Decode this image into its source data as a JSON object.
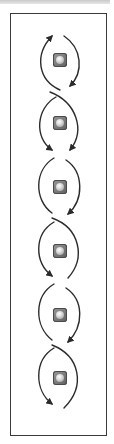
{
  "diagram": {
    "type": "double-helix-flow",
    "node_count": 6,
    "colors": {
      "stroke": "#2b2b2b",
      "frame": "#3a3a3a",
      "node_fill": "#7a7a7a",
      "node_highlight": "#ffffff"
    },
    "nodes": [
      {
        "id": "node-1",
        "cy": 60
      },
      {
        "id": "node-2",
        "cy": 123
      },
      {
        "id": "node-3",
        "cy": 187
      },
      {
        "id": "node-4",
        "cy": 251
      },
      {
        "id": "node-5",
        "cy": 315
      },
      {
        "id": "node-6",
        "cy": 378
      }
    ]
  }
}
